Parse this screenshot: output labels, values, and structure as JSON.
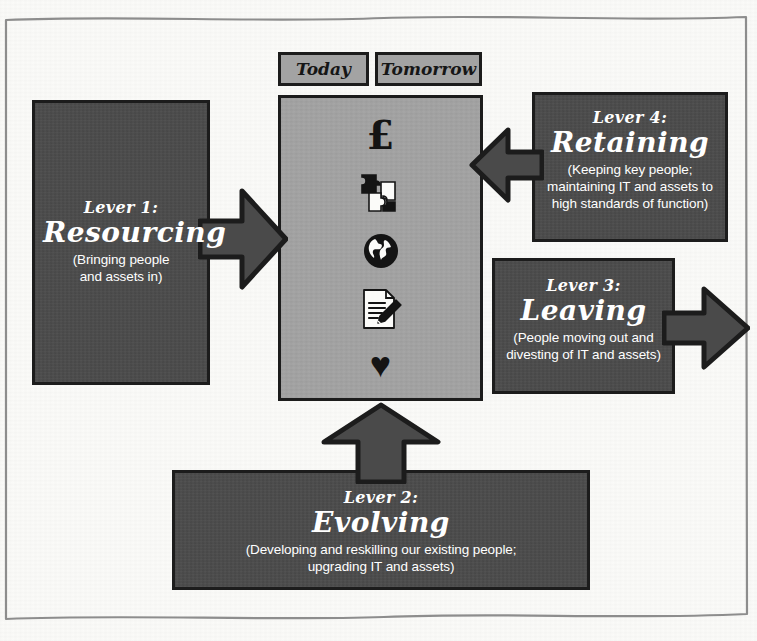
{
  "diagram": {
    "colors": {
      "paper": "#fbfbf9",
      "box_fill": "#4a4a4a",
      "box_stroke": "#1c1c1c",
      "centre_fill": "#a3a3a3",
      "text": "#ffffff"
    }
  },
  "tabs": [
    {
      "label": "Today"
    },
    {
      "label": "Tomorrow"
    }
  ],
  "centre": {
    "icons": [
      {
        "name": "pound-sterling-icon",
        "glyph": "£"
      },
      {
        "name": "puzzle-pieces-icon",
        "glyph": ""
      },
      {
        "name": "globe-icon",
        "glyph": ""
      },
      {
        "name": "document-pencil-icon",
        "glyph": ""
      },
      {
        "name": "heart-icon",
        "glyph": "♥"
      }
    ]
  },
  "levers": [
    {
      "id": "lever-1",
      "number": "Lever 1:",
      "name": "Resourcing",
      "description": "(Bringing people\nand assets in)",
      "desc_line_1": "(Bringing people",
      "desc_line_2": "and assets in)",
      "arrow_direction": "right"
    },
    {
      "id": "lever-2",
      "number": "Lever 2:",
      "name": "Evolving",
      "description": "(Developing and reskilling our existing people;\nupgrading IT and assets)",
      "desc_line_1": "(Developing and reskilling our existing people;",
      "desc_line_2": "upgrading IT and assets)",
      "arrow_direction": "up"
    },
    {
      "id": "lever-3",
      "number": "Lever 3:",
      "name": "Leaving",
      "description": "(People moving out and\ndivesting of IT and assets)",
      "desc_line_1": "(People moving out and",
      "desc_line_2": "divesting of IT and assets)",
      "arrow_direction": "right"
    },
    {
      "id": "lever-4",
      "number": "Lever 4:",
      "name": "Retaining",
      "description": "(Keeping key people;\nmaintaining IT and assets to\nhigh standards of function)",
      "desc_line_1": "(Keeping key people;",
      "desc_line_2": "maintaining IT and assets to",
      "desc_line_3": "high standards of function)",
      "arrow_direction": "left"
    }
  ]
}
